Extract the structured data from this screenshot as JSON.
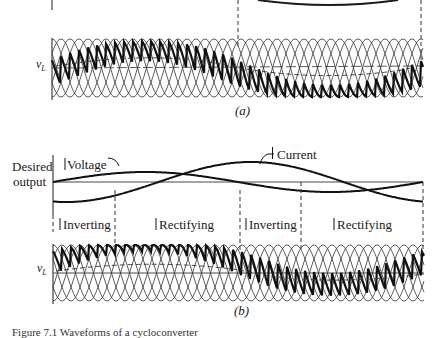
{
  "figure": {
    "panel_a": {
      "label": "(a)",
      "axis_label": "v",
      "axis_label_sub": "L"
    },
    "panel_b": {
      "label": "(b)",
      "desired_output_label_line1": "Desired",
      "desired_output_label_line2": "output",
      "voltage_label": "Voltage",
      "current_label": "Current",
      "axis_label": "v",
      "axis_label_sub": "L",
      "regions": [
        {
          "label": "Inverting"
        },
        {
          "label": "Rectifying"
        },
        {
          "label": "Inverting"
        },
        {
          "label": "Rectifying"
        }
      ]
    },
    "caption": "Figure 7.1 Waveforms of a cycloconverter"
  },
  "colors": {
    "ink": "#1a1a1a",
    "thin_line": "#333333",
    "background": "#ffffff"
  }
}
